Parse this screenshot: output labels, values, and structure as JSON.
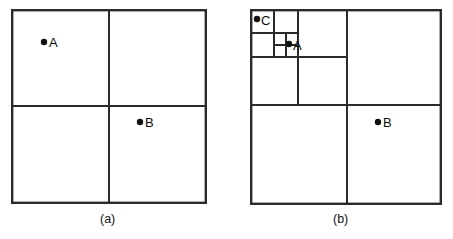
{
  "figure": {
    "background_color": "#ffffff",
    "line_color": "#2b2b2b",
    "dot_color": "#101010",
    "panels": [
      {
        "id": "a",
        "caption": "(a)",
        "bounds": {
          "x": 11,
          "y": 9,
          "width": 196,
          "height": 195
        },
        "outer_stroke_width": 2.4,
        "divider_stroke_width": 2.0,
        "subdivision_depth": 1,
        "dividers": [
          {
            "name": "vertical-center",
            "orientation": "vertical",
            "x": 109,
            "y1": 9,
            "y2": 204
          },
          {
            "name": "horizontal-center",
            "orientation": "horizontal",
            "y": 106,
            "x1": 11,
            "x2": 207
          }
        ],
        "points": [
          {
            "label": "A",
            "cx": 44,
            "cy": 42,
            "r": 3.2,
            "label_x": 49,
            "label_y": 36,
            "quadrant": "upper-left"
          },
          {
            "label": "B",
            "cx": 140,
            "cy": 122,
            "r": 3.2,
            "label_x": 145,
            "label_y": 116,
            "quadrant": "lower-right"
          }
        ]
      },
      {
        "id": "b",
        "caption": "(b)",
        "bounds": {
          "x": 250,
          "y": 9,
          "width": 192,
          "height": 196
        },
        "outer_stroke_width": 2.4,
        "divider_stroke_width": 2.0,
        "subdivision_depth": 4,
        "dividers": [
          {
            "name": "vertical-center",
            "orientation": "vertical",
            "x": 347,
            "y1": 9,
            "y2": 205
          },
          {
            "name": "horizontal-center",
            "orientation": "horizontal",
            "y": 105,
            "x1": 250,
            "x2": 442
          },
          {
            "name": "ul-vertical-half",
            "orientation": "vertical",
            "x": 298,
            "y1": 9,
            "y2": 105
          },
          {
            "name": "ul-horizontal-half",
            "orientation": "horizontal",
            "y": 57,
            "x1": 250,
            "x2": 347
          },
          {
            "name": "ul-ul-vertical-half",
            "orientation": "vertical",
            "x": 274,
            "y1": 9,
            "y2": 57
          },
          {
            "name": "ul-ul-horizontal-half",
            "orientation": "horizontal",
            "y": 33,
            "x1": 250,
            "x2": 298
          },
          {
            "name": "ul-ul-lr-vertical-half",
            "orientation": "vertical",
            "x": 286,
            "y1": 33,
            "y2": 57
          },
          {
            "name": "ul-ul-lr-horizontal-half",
            "orientation": "horizontal",
            "y": 45,
            "x1": 274,
            "x2": 298
          }
        ],
        "points": [
          {
            "label": "C",
            "cx": 257,
            "cy": 19,
            "r": 3.2,
            "label_x": 261,
            "label_y": 14,
            "quadrant": "upper-left-deep"
          },
          {
            "label": "A",
            "cx": 289,
            "cy": 44,
            "r": 3.2,
            "label_x": 293,
            "label_y": 39,
            "quadrant": "upper-left-deep"
          },
          {
            "label": "B",
            "cx": 378,
            "cy": 122,
            "r": 3.2,
            "label_x": 383,
            "label_y": 116,
            "quadrant": "lower-right"
          }
        ]
      }
    ]
  }
}
